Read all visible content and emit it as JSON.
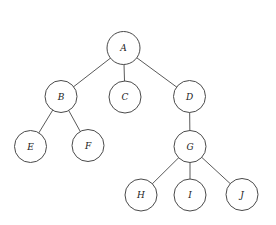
{
  "diagram": {
    "type": "tree",
    "nodes": [
      {
        "id": "A",
        "label": "A",
        "cx": 123.5,
        "cy": 48,
        "r": 16.5
      },
      {
        "id": "B",
        "label": "B",
        "cx": 61,
        "cy": 96.5,
        "r": 16
      },
      {
        "id": "C",
        "label": "C",
        "cx": 125,
        "cy": 97,
        "r": 16
      },
      {
        "id": "D",
        "label": "D",
        "cx": 189.5,
        "cy": 96.5,
        "r": 16
      },
      {
        "id": "E",
        "label": "E",
        "cx": 30.5,
        "cy": 146.5,
        "r": 16
      },
      {
        "id": "F",
        "label": "F",
        "cx": 88,
        "cy": 145.5,
        "r": 16
      },
      {
        "id": "G",
        "label": "G",
        "cx": 190,
        "cy": 146.5,
        "r": 16
      },
      {
        "id": "H",
        "label": "H",
        "cx": 141,
        "cy": 195,
        "r": 16
      },
      {
        "id": "I",
        "label": "I",
        "cx": 190,
        "cy": 195,
        "r": 16
      },
      {
        "id": "J",
        "label": "J",
        "cx": 242,
        "cy": 194.5,
        "r": 16
      }
    ],
    "edges": [
      {
        "from": "A",
        "to": "B"
      },
      {
        "from": "A",
        "to": "C"
      },
      {
        "from": "A",
        "to": "D"
      },
      {
        "from": "B",
        "to": "E"
      },
      {
        "from": "B",
        "to": "F"
      },
      {
        "from": "D",
        "to": "G"
      },
      {
        "from": "G",
        "to": "H"
      },
      {
        "from": "G",
        "to": "I"
      },
      {
        "from": "G",
        "to": "J"
      }
    ]
  }
}
